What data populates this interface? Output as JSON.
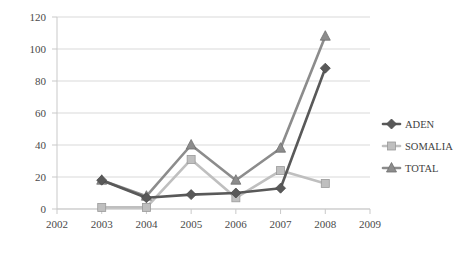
{
  "chart_data": {
    "type": "line",
    "title": "",
    "xlabel": "",
    "ylabel": "",
    "categories": [
      "2002",
      "2003",
      "2004",
      "2005",
      "2006",
      "2007",
      "2008",
      "2009"
    ],
    "x_ticks": [
      "2002",
      "2003",
      "2004",
      "2005",
      "2006",
      "2007",
      "2008",
      "2009"
    ],
    "y_ticks": [
      "0",
      "20",
      "40",
      "60",
      "80",
      "100",
      "120"
    ],
    "ylim": [
      0,
      120
    ],
    "grid": true,
    "legend_position": "right",
    "series": [
      {
        "name": "ADEN",
        "color": "#595959",
        "marker": "diamond",
        "x": [
          "2003",
          "2004",
          "2005",
          "2006",
          "2007",
          "2008"
        ],
        "values": [
          18,
          7,
          9,
          10,
          13,
          88
        ]
      },
      {
        "name": "SOMALIA",
        "color": "#bfbfbf",
        "marker": "square",
        "x": [
          "2003",
          "2004",
          "2005",
          "2006",
          "2007",
          "2008"
        ],
        "values": [
          1,
          1,
          31,
          7,
          24,
          16
        ]
      },
      {
        "name": "TOTAL",
        "color": "#8c8c8c",
        "marker": "triangle",
        "x": [
          "2003",
          "2004",
          "2005",
          "2006",
          "2007",
          "2008"
        ],
        "values": [
          18,
          8,
          40,
          18,
          38,
          108
        ]
      }
    ]
  },
  "legend": {
    "items": [
      {
        "label": "ADEN"
      },
      {
        "label": "SOMALIA"
      },
      {
        "label": "TOTAL"
      }
    ]
  }
}
